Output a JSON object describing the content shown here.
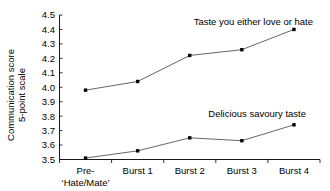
{
  "chart_data": {
    "type": "line",
    "title": "",
    "xlabel": "",
    "ylabel": "Communication score\n5-point scale",
    "ylabel_line1": "Communication score",
    "ylabel_line2": "5-point scale",
    "categories": [
      "Pre-‘Hate/Mate’",
      "Burst 1",
      "Burst 2",
      "Burst 3",
      "Burst 4"
    ],
    "category_labels": [
      {
        "line1": "Pre-",
        "line2": "‘Hate/Mate’"
      },
      {
        "line1": "Burst 1",
        "line2": ""
      },
      {
        "line1": "Burst 2",
        "line2": ""
      },
      {
        "line1": "Burst 3",
        "line2": ""
      },
      {
        "line1": "Burst 4",
        "line2": ""
      }
    ],
    "ylim": [
      3.5,
      4.5
    ],
    "yticks": [
      "3.5",
      "3.6",
      "3.7",
      "3.8",
      "3.9",
      "4.0",
      "4.1",
      "4.2",
      "4.3",
      "4.4",
      "4.5"
    ],
    "ytick_values": [
      3.5,
      3.6,
      3.7,
      3.8,
      3.9,
      4.0,
      4.1,
      4.2,
      4.3,
      4.4,
      4.5
    ],
    "grid": false,
    "legend_position": "inline-annotation",
    "series": [
      {
        "name": "Taste you either love or hate",
        "values": [
          3.98,
          4.04,
          4.22,
          4.26,
          4.4
        ],
        "annotation": "Taste you either love or hate",
        "color": "#555555",
        "marker_color": "#000000"
      },
      {
        "name": "Delicious savoury taste",
        "values": [
          3.51,
          3.56,
          3.65,
          3.63,
          3.74
        ],
        "annotation": "Delicious savoury taste",
        "color": "#555555",
        "marker_color": "#000000"
      }
    ]
  },
  "colors": {
    "background": "#ffffff",
    "axis": "#000000",
    "line": "#555555",
    "marker": "#000000",
    "text": "#000000"
  }
}
